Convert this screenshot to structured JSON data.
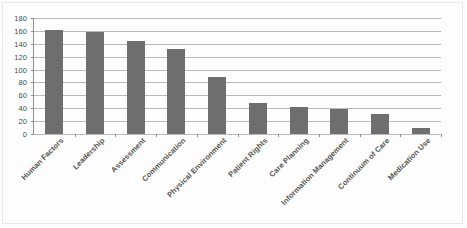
{
  "chart_data": {
    "type": "bar",
    "title": "",
    "subtitle": "",
    "xlabel": "",
    "ylabel": "",
    "ylim": [
      0,
      180
    ],
    "ytick_step": 20,
    "yticks": [
      180,
      160,
      140,
      120,
      100,
      80,
      60,
      40,
      20,
      0
    ],
    "grid": true,
    "legend": "none",
    "bar_color": "#6e6e6e",
    "axis_color": "#8d8d8d",
    "gridline_color": "#b9b9b9",
    "categories": [
      "Human Factors",
      "Leadership",
      "Assessment",
      "Communication",
      "Physical Environment",
      "Patient Rights",
      "Care Planning",
      "Information Management",
      "Continuum of Care",
      "Medication Use"
    ],
    "values": [
      161,
      158,
      145,
      132,
      89,
      48,
      42,
      39,
      31,
      10
    ],
    "series": [
      {
        "name": "Root cause count",
        "values": [
          161,
          158,
          145,
          132,
          89,
          48,
          42,
          39,
          31,
          10
        ]
      }
    ]
  }
}
